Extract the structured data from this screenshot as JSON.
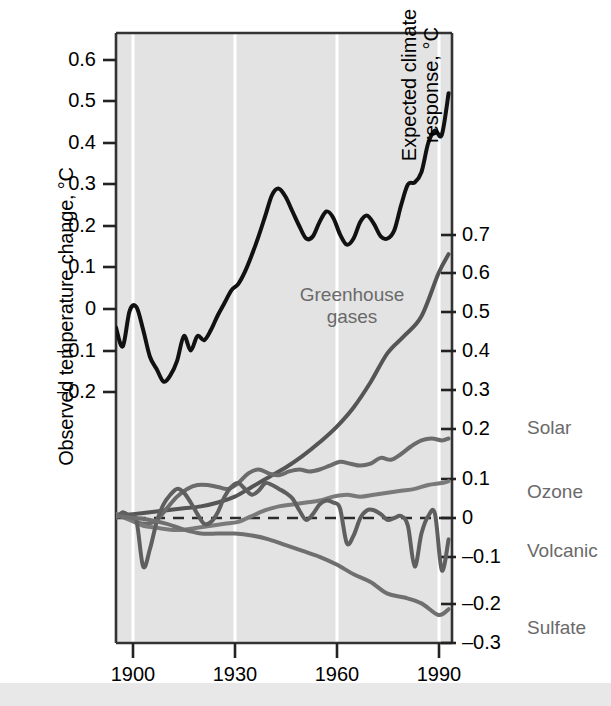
{
  "chart_data": {
    "type": "line",
    "title": "",
    "xlabel": "",
    "x_ticks": [
      1900,
      1930,
      1960,
      1990
    ],
    "xlim": [
      1895,
      1994
    ],
    "left_axis": {
      "label": "Observed temperature change, °C",
      "ticks": [
        "0.6",
        "0.5",
        "0.4",
        "0.3",
        "0.2",
        "0.1",
        "0",
        "–0.1",
        "–0.2"
      ],
      "tick_values": [
        0.6,
        0.5,
        0.4,
        0.3,
        0.2,
        0.1,
        0,
        -0.1,
        -0.2
      ],
      "ylim": [
        -0.28,
        0.675
      ]
    },
    "right_axis": {
      "label": "Expected climate response, °C",
      "ticks": [
        "0.7",
        "0.6",
        "0.5",
        "0.4",
        "0.3",
        "0.2",
        "0.1",
        "0",
        "–0.1",
        "–0.2",
        "–0.3"
      ],
      "tick_values": [
        0.7,
        0.6,
        0.5,
        0.4,
        0.3,
        0.2,
        0.1,
        0,
        -0.1,
        -0.2,
        -0.3
      ],
      "ylim": [
        -0.3,
        0.755
      ]
    },
    "grid": "vertical white gridlines at x ticks",
    "zero_line": "dashed at 0 of right axis",
    "legend_position": "inline labels at right of plot",
    "series": [
      {
        "name": "Observed temperature change",
        "axis": "left",
        "color": "#111111",
        "width": 4,
        "x": [
          1895,
          1897,
          1899,
          1901,
          1903,
          1905,
          1907,
          1909,
          1911,
          1913,
          1915,
          1917,
          1919,
          1921,
          1923,
          1925,
          1927,
          1929,
          1931,
          1933,
          1935,
          1937,
          1939,
          1941,
          1943,
          1945,
          1947,
          1949,
          1951,
          1953,
          1955,
          1957,
          1959,
          1961,
          1963,
          1965,
          1967,
          1969,
          1971,
          1973,
          1975,
          1977,
          1979,
          1981,
          1983,
          1985,
          1987,
          1989,
          1991,
          1993
        ],
        "values": [
          -0.045,
          -0.09,
          -0.005,
          0.005,
          -0.05,
          -0.115,
          -0.145,
          -0.175,
          -0.16,
          -0.125,
          -0.065,
          -0.1,
          -0.065,
          -0.075,
          -0.05,
          -0.015,
          0.015,
          0.045,
          0.06,
          0.09,
          0.13,
          0.175,
          0.225,
          0.275,
          0.29,
          0.27,
          0.235,
          0.2,
          0.17,
          0.175,
          0.21,
          0.235,
          0.22,
          0.18,
          0.155,
          0.17,
          0.21,
          0.225,
          0.205,
          0.175,
          0.17,
          0.19,
          0.25,
          0.3,
          0.305,
          0.33,
          0.4,
          0.43,
          0.42,
          0.52
        ]
      },
      {
        "name": "Greenhouse gases",
        "axis": "right",
        "color": "#555555",
        "width": 4,
        "x": [
          1895,
          1900,
          1905,
          1910,
          1915,
          1920,
          1925,
          1930,
          1935,
          1940,
          1945,
          1950,
          1955,
          1960,
          1965,
          1970,
          1975,
          1980,
          1985,
          1990,
          1993
        ],
        "values": [
          0.005,
          0.01,
          0.015,
          0.02,
          0.025,
          0.03,
          0.04,
          0.055,
          0.08,
          0.105,
          0.13,
          0.16,
          0.195,
          0.235,
          0.285,
          0.35,
          0.425,
          0.47,
          0.52,
          0.63,
          0.68
        ]
      },
      {
        "name": "Solar",
        "axis": "right",
        "color": "#6b6b6b",
        "width": 4,
        "x": [
          1895,
          1898,
          1901,
          1904,
          1907,
          1910,
          1913,
          1916,
          1919,
          1922,
          1925,
          1928,
          1931,
          1934,
          1937,
          1940,
          1943,
          1946,
          1949,
          1952,
          1955,
          1958,
          1961,
          1964,
          1967,
          1970,
          1973,
          1976,
          1979,
          1982,
          1985,
          1988,
          1991,
          1993
        ],
        "values": [
          0.01,
          0.005,
          -0.01,
          -0.015,
          -0.005,
          0.025,
          0.055,
          0.075,
          0.085,
          0.085,
          0.08,
          0.075,
          0.09,
          0.115,
          0.125,
          0.115,
          0.11,
          0.12,
          0.125,
          0.12,
          0.125,
          0.135,
          0.145,
          0.14,
          0.135,
          0.14,
          0.155,
          0.15,
          0.165,
          0.185,
          0.2,
          0.205,
          0.2,
          0.205
        ]
      },
      {
        "name": "Ozone",
        "axis": "right",
        "color": "#7a7a7a",
        "width": 4,
        "x": [
          1895,
          1899,
          1903,
          1907,
          1911,
          1915,
          1919,
          1923,
          1927,
          1931,
          1935,
          1939,
          1943,
          1947,
          1951,
          1955,
          1959,
          1963,
          1967,
          1971,
          1975,
          1979,
          1983,
          1987,
          1991,
          1993
        ],
        "values": [
          0.01,
          -0.005,
          -0.02,
          -0.025,
          -0.03,
          -0.03,
          -0.025,
          -0.02,
          -0.015,
          -0.01,
          0.005,
          0.02,
          0.03,
          0.035,
          0.04,
          0.045,
          0.055,
          0.06,
          0.055,
          0.06,
          0.065,
          0.07,
          0.075,
          0.085,
          0.09,
          0.095
        ]
      },
      {
        "name": "Volcanic",
        "axis": "right",
        "color": "#5f5f5f",
        "width": 4,
        "x": [
          1895,
          1897,
          1899,
          1901,
          1903,
          1905,
          1907,
          1909,
          1911,
          1913,
          1915,
          1917,
          1919,
          1921,
          1923,
          1925,
          1927,
          1929,
          1931,
          1933,
          1935,
          1937,
          1939,
          1941,
          1943,
          1945,
          1947,
          1949,
          1951,
          1953,
          1955,
          1957,
          1959,
          1961,
          1963,
          1965,
          1967,
          1969,
          1971,
          1973,
          1975,
          1977,
          1979,
          1981,
          1983,
          1985,
          1987,
          1989,
          1991,
          1993
        ],
        "values": [
          0.0,
          0.015,
          0.005,
          -0.005,
          -0.125,
          -0.08,
          -0.01,
          0.035,
          0.06,
          0.075,
          0.065,
          0.04,
          0.01,
          -0.015,
          -0.01,
          0.015,
          0.055,
          0.08,
          0.09,
          0.075,
          0.06,
          0.07,
          0.09,
          0.085,
          0.075,
          0.065,
          0.05,
          0.02,
          -0.005,
          0.01,
          0.035,
          0.045,
          0.04,
          0.025,
          -0.065,
          -0.045,
          0.0,
          0.02,
          0.02,
          0.01,
          -0.005,
          0.0,
          0.005,
          -0.02,
          -0.125,
          -0.04,
          0.005,
          0.01,
          -0.135,
          -0.055
        ]
      },
      {
        "name": "Sulfate",
        "axis": "right",
        "color": "#6f6f6f",
        "width": 4,
        "x": [
          1895,
          1900,
          1905,
          1910,
          1915,
          1920,
          1925,
          1930,
          1935,
          1940,
          1945,
          1950,
          1955,
          1960,
          1965,
          1970,
          1975,
          1980,
          1985,
          1990,
          1993
        ],
        "values": [
          0.005,
          0.0,
          -0.005,
          -0.015,
          -0.03,
          -0.04,
          -0.04,
          -0.04,
          -0.045,
          -0.055,
          -0.07,
          -0.085,
          -0.1,
          -0.12,
          -0.145,
          -0.165,
          -0.195,
          -0.205,
          -0.22,
          -0.25,
          -0.235
        ]
      }
    ],
    "series_labels": [
      {
        "name": "Greenhouse gases",
        "line1": "Greenhouse",
        "line2": "gases"
      },
      {
        "name": "Solar",
        "text": "Solar"
      },
      {
        "name": "Ozone",
        "text": "Ozone"
      },
      {
        "name": "Volcanic",
        "text": "Volcanic"
      },
      {
        "name": "Sulfate",
        "text": "Sulfate"
      }
    ],
    "colors": {
      "plot_background": "#e3e3e3",
      "gridline": "#ffffff",
      "observed_line": "#111111",
      "response_line": "#666666",
      "axis": "#333333",
      "label_text": "#6a6a6a",
      "tick_text": "#000000",
      "page_background": "#ffffff",
      "bottom_band": "#e8e8e8"
    }
  }
}
